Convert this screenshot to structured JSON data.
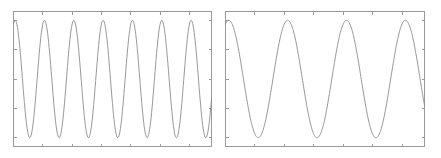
{
  "figure": {
    "title": "",
    "width": 441,
    "height": 158,
    "background_color": "#ffffff",
    "panel_count": 2
  },
  "style": {
    "frame_color": "#9a9a9a",
    "tick_color": "#9a9a9a",
    "line_color": "#8c8c8c",
    "line_width": 0.9
  },
  "chart_data": [
    {
      "type": "line",
      "name": "left-panel",
      "title": "",
      "xlabel": "",
      "ylabel": "",
      "xlim": [
        0,
        6.75
      ],
      "ylim": [
        -1.15,
        1.15
      ],
      "grid": false,
      "legend": false,
      "legend_position": "none",
      "xticks": [
        0,
        1,
        2,
        3,
        4,
        5,
        6
      ],
      "yticks": [
        -1,
        -0.5,
        0,
        0.5,
        1
      ],
      "xticklabels": [
        "",
        "",
        "",
        "",
        "",
        "",
        ""
      ],
      "yticklabels": [
        "",
        "",
        "",
        "",
        ""
      ],
      "tick_direction": "in",
      "series": [
        {
          "name": "sine",
          "waveform": "sine",
          "amplitude": 1.0,
          "cycles": 6.75,
          "phase_deg": 70,
          "samples": 400
        }
      ],
      "plot_box_px": {
        "x": 13,
        "y": 11,
        "width": 199,
        "height": 136
      }
    },
    {
      "type": "line",
      "name": "right-panel",
      "title": "",
      "xlabel": "",
      "ylabel": "",
      "xlim": [
        0,
        3.38
      ],
      "ylim": [
        -1.15,
        1.15
      ],
      "grid": false,
      "legend": false,
      "legend_position": "none",
      "xticks": [
        0,
        0.5,
        1,
        1.5,
        2,
        2.5,
        3
      ],
      "yticks": [
        -1,
        -0.5,
        0,
        0.5,
        1
      ],
      "xticklabels": [
        "",
        "",
        "",
        "",
        "",
        "",
        ""
      ],
      "yticklabels": [
        "",
        "",
        "",
        "",
        ""
      ],
      "tick_direction": "in",
      "series": [
        {
          "name": "sine",
          "waveform": "sine",
          "amplitude": 1.0,
          "cycles": 3.38,
          "phase_deg": 70,
          "samples": 400
        }
      ],
      "plot_box_px": {
        "x": 225,
        "y": 11,
        "width": 200,
        "height": 136
      }
    }
  ]
}
